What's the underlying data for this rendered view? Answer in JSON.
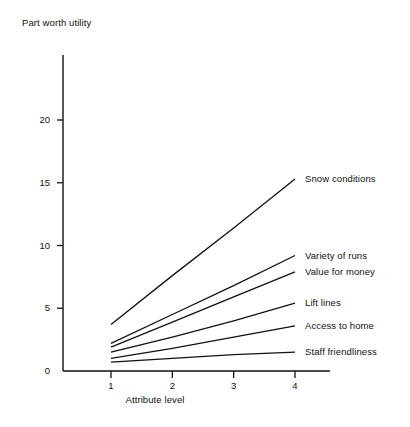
{
  "chart_data": {
    "type": "line",
    "title": "",
    "ylabel": "Part worth utility",
    "xlabel": "Attribute level",
    "x": [
      1,
      2,
      3,
      4
    ],
    "xtick_labels": [
      "1",
      "2",
      "3",
      "4"
    ],
    "ytick_labels": [
      "0",
      "5",
      "10",
      "15",
      "20"
    ],
    "ytick_values": [
      0,
      5,
      10,
      15,
      20
    ],
    "xlim": [
      1,
      4
    ],
    "ylim": [
      0,
      23
    ],
    "grid": false,
    "legend_position": "right-of-line-ends",
    "line_color": "#111111",
    "background_color": "#ffffff",
    "series": [
      {
        "name": "Snow conditions",
        "values": [
          3.7,
          7.6,
          11.4,
          15.3
        ]
      },
      {
        "name": "Variety of runs",
        "values": [
          2.2,
          4.5,
          6.8,
          9.2
        ]
      },
      {
        "name": "Value for money",
        "values": [
          1.9,
          3.9,
          5.9,
          7.9
        ]
      },
      {
        "name": "Lift lines",
        "values": [
          1.5,
          2.7,
          4.0,
          5.4
        ]
      },
      {
        "name": "Access to home",
        "values": [
          1.0,
          1.8,
          2.7,
          3.6
        ]
      },
      {
        "name": "Staff friendliness",
        "values": [
          0.7,
          1.0,
          1.3,
          1.5
        ]
      }
    ]
  },
  "labels": {
    "y_axis_title": "Part worth utility",
    "x_axis_title": "Attribute level",
    "ytick_0": "0",
    "ytick_5": "5",
    "ytick_10": "10",
    "ytick_15": "15",
    "ytick_20": "20",
    "xtick_1": "1",
    "xtick_2": "2",
    "xtick_3": "3",
    "xtick_4": "4",
    "series_0": "Snow conditions",
    "series_1": "Variety of runs",
    "series_2": "Value for money",
    "series_3": "Lift lines",
    "series_4": "Access to home",
    "series_5": "Staff friendliness"
  }
}
